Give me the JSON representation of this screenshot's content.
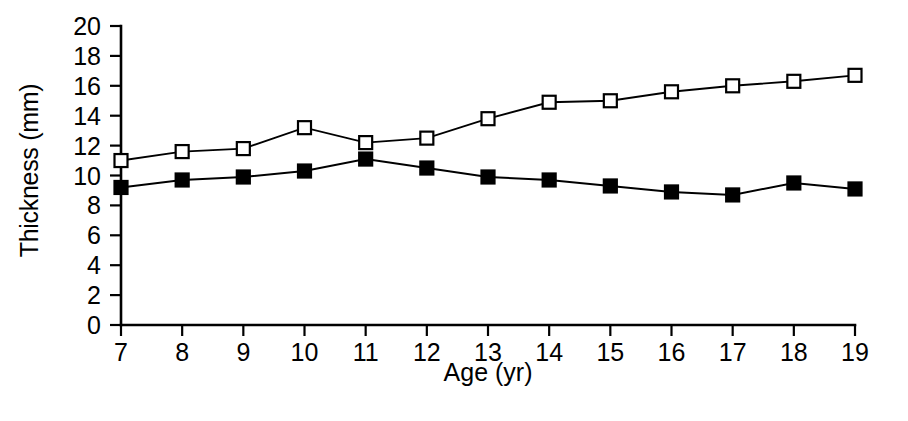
{
  "chart_data": {
    "type": "line",
    "title": "",
    "subtitle": "",
    "xlabel": "Age (yr)",
    "ylabel": "Thickness (mm)",
    "x": [
      7,
      8,
      9,
      10,
      11,
      12,
      13,
      14,
      15,
      16,
      17,
      18,
      19
    ],
    "xtick_labels": [
      "7",
      "8",
      "9",
      "10",
      "11",
      "12",
      "13",
      "14",
      "15",
      "16",
      "17",
      "18",
      "19"
    ],
    "ytick_labels": [
      "0",
      "2",
      "4",
      "6",
      "8",
      "10",
      "12",
      "14",
      "16",
      "18",
      "20"
    ],
    "ytick_values": [
      0,
      2,
      4,
      6,
      8,
      10,
      12,
      14,
      16,
      18,
      20
    ],
    "xlim": [
      7,
      19
    ],
    "ylim": [
      0,
      20
    ],
    "grid": false,
    "legend_position": "none",
    "series": [
      {
        "name": "open-square-series",
        "marker": "open-square",
        "color": "#000000",
        "values": [
          11.0,
          11.6,
          11.8,
          13.2,
          12.2,
          12.5,
          13.8,
          14.9,
          15.0,
          15.6,
          16.0,
          16.3,
          16.7
        ]
      },
      {
        "name": "filled-square-series",
        "marker": "filled-square",
        "color": "#000000",
        "values": [
          9.2,
          9.7,
          9.9,
          10.3,
          11.1,
          10.5,
          9.9,
          9.7,
          9.3,
          8.9,
          8.7,
          9.5,
          9.1
        ]
      }
    ],
    "annotations": []
  }
}
